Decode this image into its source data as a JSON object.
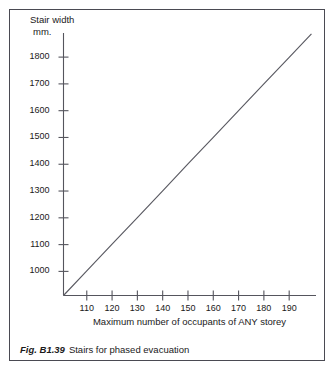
{
  "figure": {
    "caption_number": "Fig. B1.39",
    "caption_text": "Stairs for phased evacuation",
    "border_color": "#4a4a52",
    "background_color": "#ffffff",
    "ink_color": "#1a1a1a"
  },
  "chart_data": {
    "type": "line",
    "title": "",
    "subtitle": "",
    "xlabel": "Maximum number of occupants of ANY storey",
    "ylabel_line1": "Stair width",
    "ylabel_line2": "mm.",
    "ylabel": "Stair width mm.",
    "xlim": [
      100.8,
      200.6
    ],
    "ylim": [
      910,
      1890
    ],
    "xticks": [
      110,
      120,
      130,
      140,
      150,
      160,
      170,
      180,
      190
    ],
    "xtick_labels": [
      "110",
      "120",
      "130",
      "140",
      "150",
      "160",
      "170",
      "180",
      "190"
    ],
    "yticks": [
      1000,
      1100,
      1200,
      1300,
      1400,
      1500,
      1600,
      1700,
      1800
    ],
    "ytick_labels": [
      "1000",
      "1100",
      "1200",
      "1300",
      "1400",
      "1500",
      "1600",
      "1700",
      "1800"
    ],
    "grid": false,
    "legend": null,
    "legend_position": "none",
    "line_color": "#5a5a62",
    "axis_color": "#55555d",
    "series": [
      {
        "name": "Stair width",
        "x": [
          100.8,
          110,
          120,
          130,
          140,
          150,
          160,
          170,
          180,
          190,
          198.8
        ],
        "y": [
          910,
          1002,
          1102,
          1201,
          1301,
          1401,
          1500,
          1600,
          1700,
          1799,
          1887
        ]
      }
    ],
    "annotations": []
  }
}
